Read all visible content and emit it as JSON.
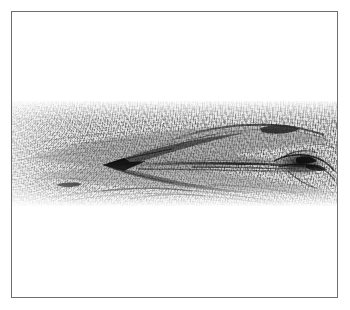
{
  "figure": {
    "domain_label": "Natural-Image",
    "kind": "grayscale-micrograph",
    "alt_text": "Grayscale micrograph: horizontal fibrous striated band with dark seams, a left-pointing wedge and a tangled dark knot at right",
    "frame": {
      "border_color": "#6e6e72",
      "border_width_px": 1,
      "background_color": "#ffffff",
      "x": 11,
      "y": 11,
      "width": 327,
      "height": 287
    },
    "band": {
      "label": "specimen-band",
      "x": 0,
      "y": 89,
      "width": 327,
      "height": 105,
      "base_tone": "#d8d8d8",
      "dark_tone": "#1a1a1a",
      "mid_tone": "#8a8a8a",
      "light_tone": "#f2f2f2"
    },
    "features": [
      {
        "name": "left-wedge-apex",
        "x": 104,
        "y": 153,
        "note": "dark left-pointing arrow apex"
      },
      {
        "name": "left-dark-lens",
        "x": 56,
        "y": 173,
        "note": "small elongated dark blob"
      },
      {
        "name": "central-long-seam",
        "x0": 118,
        "x1": 300,
        "y": 155,
        "note": "long thin dark streak"
      },
      {
        "name": "upper-dark-arc",
        "x0": 170,
        "x1": 285,
        "y": 118,
        "note": "arched dark fiber bundle"
      },
      {
        "name": "upper-right-blob",
        "x": 272,
        "y": 120,
        "note": "dark thickening on upper arc"
      },
      {
        "name": "right-knot",
        "x": 292,
        "y": 152,
        "note": "tangled dark knot cluster"
      },
      {
        "name": "lower-arc-convergence",
        "x": 165,
        "y": 190,
        "note": "lower seams converging"
      }
    ],
    "caption": "",
    "annotations": []
  }
}
